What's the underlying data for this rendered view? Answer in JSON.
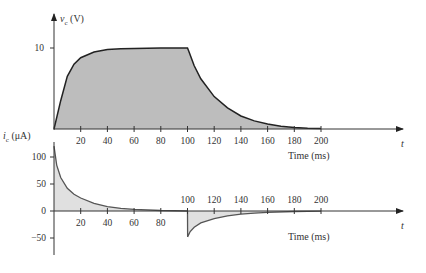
{
  "chart_data": [
    {
      "type": "area",
      "name": "capacitor-voltage",
      "ylabel": "v_c (V)",
      "ylabel_main": "v",
      "ylabel_sub": "c",
      "ylabel_unit": "(V)",
      "xlabel": "Time (ms)",
      "x_axis_var": "t",
      "yticks": [
        10
      ],
      "xticks": [
        20,
        40,
        60,
        80,
        100,
        120,
        140,
        160,
        180,
        200
      ],
      "xlim": [
        0,
        220
      ],
      "ylim": [
        0,
        12
      ],
      "grid": false,
      "x": [
        0,
        5,
        10,
        15,
        20,
        30,
        40,
        50,
        60,
        80,
        100,
        101,
        105,
        110,
        120,
        130,
        140,
        150,
        160,
        170,
        180,
        190,
        200
      ],
      "values": [
        0,
        3.5,
        6.5,
        8.0,
        8.8,
        9.5,
        9.8,
        9.9,
        9.95,
        10,
        10,
        9.6,
        7.8,
        6.2,
        4.0,
        2.6,
        1.6,
        1.0,
        0.6,
        0.35,
        0.2,
        0.1,
        0.05
      ],
      "fill_color": "#bdbdbd",
      "line_color": "#222222"
    },
    {
      "type": "area",
      "name": "capacitor-current",
      "ylabel": "i_c (μA)",
      "ylabel_main": "i",
      "ylabel_sub": "c",
      "ylabel_unit": "(μA)",
      "xlabel": "Time (ms)",
      "x_axis_var": "t",
      "yticks": [
        100,
        50,
        0,
        -50
      ],
      "xticks_below": [
        20,
        40,
        60,
        80
      ],
      "xticks_above": [
        100,
        120,
        140,
        160,
        180,
        200
      ],
      "xlim": [
        0,
        220
      ],
      "ylim": [
        -75,
        130
      ],
      "grid": false,
      "x": [
        0,
        2,
        5,
        10,
        15,
        20,
        30,
        40,
        50,
        60,
        80,
        100,
        100.1,
        102,
        105,
        110,
        120,
        130,
        140,
        150,
        160,
        180,
        200
      ],
      "values": [
        120,
        85,
        62,
        42,
        31,
        24,
        14,
        8,
        5,
        3,
        1,
        0,
        -48,
        -38,
        -30,
        -22,
        -14,
        -9,
        -6,
        -4,
        -2.5,
        -1,
        -0.3
      ],
      "fill_color": "#e0e0e0",
      "line_color": "#555555"
    }
  ]
}
